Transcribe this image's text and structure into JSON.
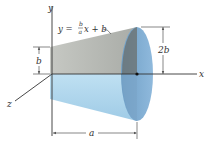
{
  "diagram": {
    "axes": {
      "x_label": "x",
      "y_label": "y",
      "z_label": "z"
    },
    "equation": {
      "prefix": "y = ",
      "numerator": "b",
      "denominator": "a",
      "suffix": "x + b"
    },
    "dimensions": {
      "small_radius": "b",
      "large_radius": "2b",
      "length": "a"
    },
    "colors": {
      "upper_surface": "#b9bcb7",
      "lower_surface": "#a9d3ea",
      "end_face": "#7ea9cf",
      "end_face_dark": "#6b6f6c",
      "axis": "#333333"
    }
  }
}
